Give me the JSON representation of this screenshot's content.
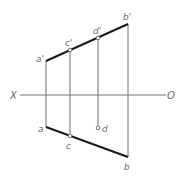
{
  "diagram": {
    "type": "orthographic-projection",
    "axis": {
      "left_label": "X",
      "right_label": "O",
      "y": 95,
      "x_start": 20,
      "x_end": 166
    },
    "front_view": {
      "line": {
        "from": "a'",
        "to": "b'"
      },
      "points": [
        {
          "name": "a'",
          "label": "a'",
          "x": 46,
          "y": 61,
          "marker": false
        },
        {
          "name": "c'",
          "label": "c'",
          "x": 70,
          "y": 50,
          "marker": true
        },
        {
          "name": "d'",
          "label": "d'",
          "x": 98,
          "y": 38,
          "marker": true
        },
        {
          "name": "b'",
          "label": "b'",
          "x": 128,
          "y": 24,
          "marker": false
        }
      ]
    },
    "top_view": {
      "line": {
        "from": "a",
        "to": "b"
      },
      "points": [
        {
          "name": "a",
          "label": "a",
          "x": 46,
          "y": 127,
          "marker": false
        },
        {
          "name": "c",
          "label": "c",
          "x": 70,
          "y": 136,
          "marker": true
        },
        {
          "name": "d",
          "label": "d",
          "x": 98,
          "y": 128,
          "marker": true
        },
        {
          "name": "b",
          "label": "b",
          "x": 128,
          "y": 157,
          "marker": false
        }
      ]
    },
    "colors": {
      "thick_line": "#1a1a1a",
      "thin_line": "#707070",
      "label": "#6a6a6a",
      "background": "#ffffff"
    }
  }
}
